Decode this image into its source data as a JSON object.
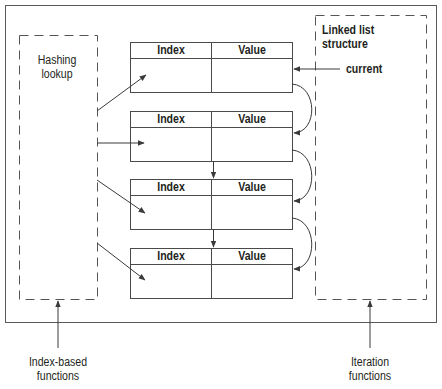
{
  "diagram": {
    "left_box": {
      "label_line1": "Hashing",
      "label_line2": "lookup"
    },
    "right_box": {
      "label_line1": "Linked list",
      "label_line2": "structure"
    },
    "current_pointer": {
      "label": "current"
    },
    "nodes": [
      {
        "index_header": "Index",
        "value_header": "Value"
      },
      {
        "index_header": "Index",
        "value_header": "Value"
      },
      {
        "index_header": "Index",
        "value_header": "Value"
      },
      {
        "index_header": "Index",
        "value_header": "Value"
      }
    ],
    "bottom_labels": {
      "index_based": {
        "line1": "Index-based",
        "line2": "functions"
      },
      "iteration": {
        "line1": "Iteration",
        "line2": "functions"
      }
    },
    "colors": {
      "stroke": "#4a4a4a",
      "text": "#231f20",
      "background": "#ffffff"
    }
  }
}
